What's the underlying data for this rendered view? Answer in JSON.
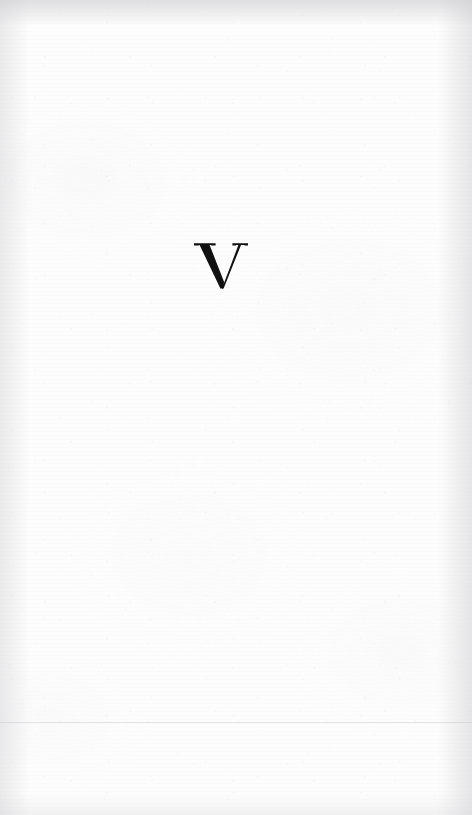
{
  "document": {
    "kind": "scanned-book-page",
    "page_type": "part-divider",
    "width_px": 472,
    "height_px": 815
  },
  "page": {
    "background_color": "#fdfdfd",
    "ink_color": "#111111"
  },
  "content": {
    "part_numeral": "V",
    "numeral_style": "roman-numeral-serif",
    "numeral_left_px": 202,
    "numeral_top_px": 244,
    "numeral_width_px": 43,
    "numeral_height_px": 44,
    "numeral_center_x_px": 223,
    "numeral_color": "#111111"
  },
  "artifacts": {
    "scan_line_y_px": 722,
    "scan_line_color": "#c6c6cb",
    "edge_shadow_color": "#c6c6c9",
    "has_paper_grain": true,
    "has_edge_shading": true
  }
}
